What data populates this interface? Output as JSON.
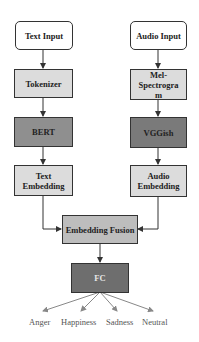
{
  "diagram": {
    "text_branch": {
      "input": "Text Input",
      "tokenizer": "Tokenizer",
      "encoder": "BERT",
      "embedding": "Text Embedding"
    },
    "audio_branch": {
      "input": "Audio Input",
      "feature": "Mel-Spectrogram",
      "encoder": "VGGish",
      "embedding": "Audio Embedding"
    },
    "fusion": "Embedding Fusion",
    "classifier": "FC",
    "outputs": [
      "Anger",
      "Happiness",
      "Sadness",
      "Neutral"
    ],
    "colors": {
      "input": "#ffffff",
      "preprocess": "#dcdcdc",
      "encoder": "#8f8f8f",
      "embedding": "#dcdcdc",
      "fusion": "#bdbdbd",
      "fc": "#6e6e6e"
    }
  }
}
